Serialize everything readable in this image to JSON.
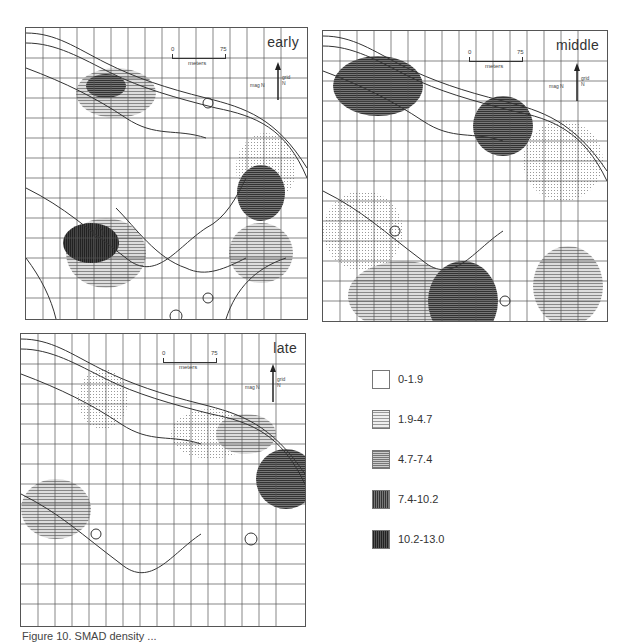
{
  "figure": {
    "panels": [
      {
        "id": "early",
        "label": "early"
      },
      {
        "id": "middle",
        "label": "middle"
      },
      {
        "id": "late",
        "label": "late"
      }
    ],
    "scale_bar": {
      "start": "0",
      "end": "75",
      "unit": "meters"
    },
    "north_arrow": {
      "grid_label": "grid N",
      "mag_label": "mag N"
    },
    "legend": {
      "items": [
        {
          "label": "0-1.9",
          "fill": "#ffffff"
        },
        {
          "label": "1.9-4.7",
          "fill": "#d9d9d9"
        },
        {
          "label": "4.7-7.4",
          "fill": "#b3b3b3"
        },
        {
          "label": "7.4-10.2",
          "fill": "#6e6e6e"
        },
        {
          "label": "10.2-13.0",
          "fill": "#3d3d3d"
        }
      ]
    },
    "caption": "Figure 10. SMAD density ..."
  }
}
